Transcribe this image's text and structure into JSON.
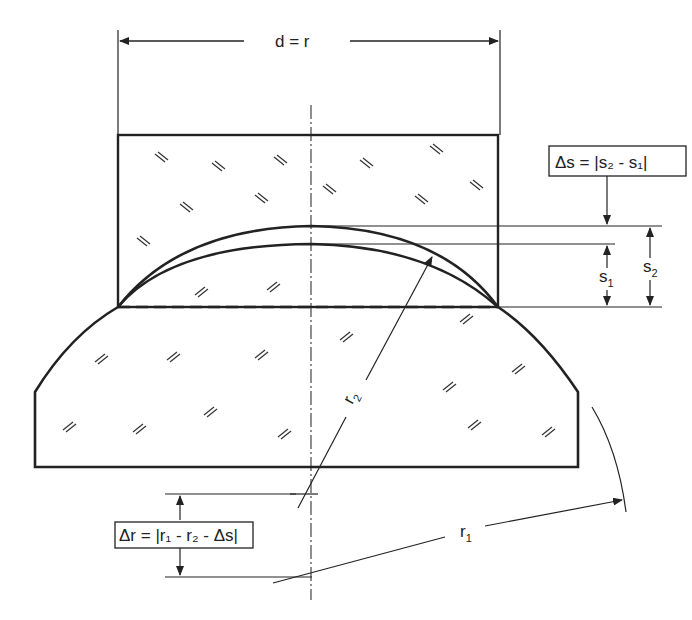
{
  "diagram": {
    "labels": {
      "diameter": "d = r",
      "delta_s": "Δs = |s₂ - s₁|",
      "s1": "s",
      "s1_sub": "1",
      "s2": "s",
      "s2_sub": "2",
      "r1": "r",
      "r1_sub": "1",
      "r2": "r",
      "r2_sub": "2",
      "delta_r": "Δr = |r₁ - r₂ - Δs|"
    },
    "colors": {
      "ink": "#222222",
      "background": "#ffffff"
    }
  }
}
